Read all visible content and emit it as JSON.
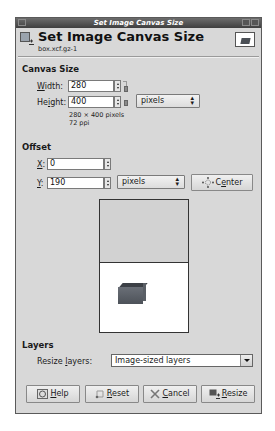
{
  "window": {
    "title": "Set Image Canvas Size"
  },
  "header": {
    "title": "Set Image Canvas Size",
    "subtitle": "box.xcf.gz-1"
  },
  "canvas_size": {
    "section_label": "Canvas Size",
    "width_label_mnemonic": "W",
    "width_label_rest": "idth:",
    "width_value": "280",
    "height_label_pre": "He",
    "height_label_mnemonic": "i",
    "height_label_rest": "ght:",
    "height_value": "400",
    "unit": "pixels",
    "dimensions_info": "280 × 400 pixels",
    "resolution_info": "72 ppi"
  },
  "offset": {
    "section_label": "Offset",
    "x_label_mnemonic": "X",
    "x_label_rest": ":",
    "x_value": "0",
    "y_label_mnemonic": "Y",
    "y_label_rest": ":",
    "y_value": "190",
    "unit": "pixels",
    "center_pre": "C",
    "center_mnemonic": "e",
    "center_rest": "nter"
  },
  "layers": {
    "section_label": "Layers",
    "resize_label_pre": "Resize ",
    "resize_label_mnemonic": "l",
    "resize_label_rest": "ayers:",
    "resize_value": "Image-sized layers"
  },
  "buttons": {
    "help_mnemonic": "H",
    "help_rest": "elp",
    "reset_mnemonic": "R",
    "reset_rest": "eset",
    "cancel_mnemonic": "C",
    "cancel_rest": "ancel",
    "resize_mnemonic": "R",
    "resize_rest": "esize"
  }
}
